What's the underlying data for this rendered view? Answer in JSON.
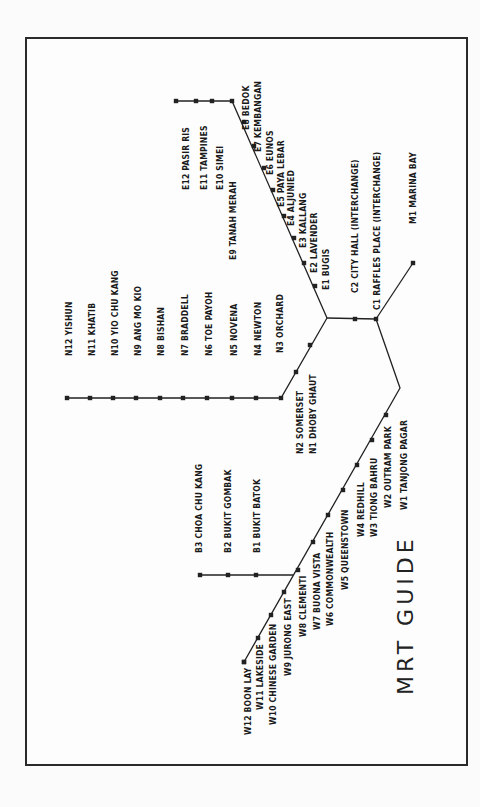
{
  "title": "MRT GUIDE",
  "colors": {
    "line": "#222222",
    "text": "#1a1a1a",
    "frame": "#2a2a2a",
    "background": "#fdfdfd"
  },
  "lines": {
    "east": {
      "path": [
        [
          176,
          101
        ],
        [
          232,
          101
        ],
        [
          327,
          318
        ]
      ],
      "stations": [
        {
          "code": "E12",
          "name": "PASIR RIS",
          "dot": [
            176,
            101
          ],
          "label": [
            182,
            190
          ]
        },
        {
          "code": "E11",
          "name": "TAMPINES",
          "dot": [
            196,
            101
          ],
          "label": [
            200,
            190
          ]
        },
        {
          "code": "E10",
          "name": "SIMEI",
          "dot": [
            212,
            101
          ],
          "label": [
            216,
            190
          ]
        },
        {
          "code": "E9",
          "name": "TANAH MERAH",
          "dot": [
            232,
            101
          ],
          "label": [
            229,
            260
          ]
        },
        {
          "code": "E8",
          "name": "BEDOK",
          "dot": [
            244,
            122
          ],
          "label": [
            242,
            130
          ]
        },
        {
          "code": "E7",
          "name": "KEMBANGAN",
          "dot": [
            254,
            146
          ],
          "label": [
            254,
            152
          ]
        },
        {
          "code": "E6",
          "name": "EUNOS",
          "dot": [
            264,
            168
          ],
          "label": [
            266,
            175
          ]
        },
        {
          "code": "E5",
          "name": "PAYA LEBAR",
          "dot": [
            273,
            190
          ],
          "label": [
            277,
            207
          ]
        },
        {
          "code": "E4",
          "name": "ALJUNIED",
          "dot": [
            284,
            216
          ],
          "label": [
            287,
            226
          ]
        },
        {
          "code": "E3",
          "name": "KALLANG",
          "dot": [
            294,
            238
          ],
          "label": [
            299,
            248
          ]
        },
        {
          "code": "E2",
          "name": "LAVENDER",
          "dot": [
            304,
            263
          ],
          "label": [
            310,
            273
          ]
        },
        {
          "code": "E1",
          "name": "BUGIS",
          "dot": [
            315,
            286
          ],
          "label": [
            322,
            290
          ]
        }
      ]
    },
    "central": {
      "path": [
        [
          327,
          318
        ],
        [
          376,
          319
        ]
      ],
      "stations": [
        {
          "code": "C2",
          "name": "CITY HALL (INTERCHANGE)",
          "dot": [
            355,
            319
          ],
          "label": [
            351,
            293
          ]
        },
        {
          "code": "C1",
          "name": "RAFFLES PLACE (INTERCHANGE)",
          "dot": [
            376,
            319
          ],
          "label": [
            373,
            310
          ]
        }
      ]
    },
    "marina": {
      "path": [
        [
          376,
          319
        ],
        [
          413,
          263
        ]
      ],
      "stations": [
        {
          "code": "M1",
          "name": "MARINA BAY",
          "dot": [
            413,
            263
          ],
          "label": [
            409,
            224
          ]
        }
      ]
    },
    "north": {
      "path": [
        [
          327,
          318
        ],
        [
          281,
          398
        ],
        [
          67,
          398
        ]
      ],
      "stations": [
        {
          "code": "N12",
          "name": "YISHUN",
          "dot": [
            67,
            398
          ],
          "label": [
            65,
            356
          ]
        },
        {
          "code": "N11",
          "name": "KHATIB",
          "dot": [
            90,
            398
          ],
          "label": [
            88,
            356
          ]
        },
        {
          "code": "N10",
          "name": "YIO CHU KANG",
          "dot": [
            113,
            398
          ],
          "label": [
            111,
            356
          ]
        },
        {
          "code": "N9",
          "name": "ANG MO KIO",
          "dot": [
            136,
            398
          ],
          "label": [
            134,
            356
          ]
        },
        {
          "code": "N8",
          "name": "BISHAN",
          "dot": [
            160,
            398
          ],
          "label": [
            157,
            356
          ]
        },
        {
          "code": "N7",
          "name": "BRADDELL",
          "dot": [
            183,
            398
          ],
          "label": [
            181,
            356
          ]
        },
        {
          "code": "N6",
          "name": "TOE PAYOH",
          "dot": [
            207,
            398
          ],
          "label": [
            205,
            356
          ]
        },
        {
          "code": "N5",
          "name": "NOVENA",
          "dot": [
            232,
            398
          ],
          "label": [
            230,
            356
          ]
        },
        {
          "code": "N4",
          "name": "NEWTON",
          "dot": [
            256,
            398
          ],
          "label": [
            254,
            356
          ]
        },
        {
          "code": "N3",
          "name": "ORCHARD",
          "dot": [
            310,
            345
          ],
          "label": [
            276,
            353
          ]
        },
        {
          "code": "N2",
          "name": "SOMERSET",
          "dot": [
            296,
            372
          ],
          "label": [
            296,
            454
          ]
        },
        {
          "code": "N1",
          "name": "DHOBY GHAUT",
          "dot": [
            281,
            398
          ],
          "label": [
            309,
            454
          ]
        }
      ]
    },
    "west": {
      "path": [
        [
          376,
          319
        ],
        [
          400,
          388
        ],
        [
          244,
          662
        ]
      ],
      "stations": [
        {
          "code": "W1",
          "name": "TANJONG PAGAR",
          "dot": [
            386,
            415
          ],
          "label": [
            400,
            510
          ]
        },
        {
          "code": "W2",
          "name": "OUTRAM PARK",
          "dot": [
            372,
            440
          ],
          "label": [
            384,
            508
          ]
        },
        {
          "code": "W3",
          "name": "TIONG BAHRU",
          "dot": [
            357,
            465
          ],
          "label": [
            370,
            537
          ]
        },
        {
          "code": "W4",
          "name": "REDHILL",
          "dot": [
            343,
            490
          ],
          "label": [
            357,
            537
          ]
        },
        {
          "code": "W5",
          "name": "QUEENSTOWN",
          "dot": [
            328,
            515
          ],
          "label": [
            341,
            590
          ]
        },
        {
          "code": "W6",
          "name": "COMMONWEALTH",
          "dot": [
            313,
            542
          ],
          "label": [
            326,
            626
          ]
        },
        {
          "code": "W7",
          "name": "BUONA VISTA",
          "dot": [
            298,
            570
          ],
          "label": [
            313,
            630
          ]
        },
        {
          "code": "W8",
          "name": "CLEMENTI",
          "dot": [
            284,
            592
          ],
          "label": [
            299,
            637
          ]
        },
        {
          "code": "W9",
          "name": "JURONG EAST",
          "dot": [
            271,
            615
          ],
          "label": [
            284,
            676
          ]
        },
        {
          "code": "W10",
          "name": "CHINESE GARDEN",
          "dot": [
            258,
            638
          ],
          "label": [
            269,
            725
          ]
        },
        {
          "code": "W11",
          "name": "LAKESIDE",
          "dot": [
            244,
            662
          ],
          "label": [
            256,
            710
          ]
        },
        {
          "code": "W12",
          "name": "BOON LAY",
          "dot": [
            244,
            662
          ],
          "label": [
            244,
            735
          ]
        }
      ]
    },
    "bukit": {
      "path": [
        [
          200,
          575
        ],
        [
          293,
          575
        ]
      ],
      "stations": [
        {
          "code": "B3",
          "name": "CHOA CHU KANG",
          "dot": [
            200,
            575
          ],
          "label": [
            195,
            553
          ]
        },
        {
          "code": "B2",
          "name": "BUKIT GOMBAK",
          "dot": [
            228,
            575
          ],
          "label": [
            224,
            553
          ]
        },
        {
          "code": "B1",
          "name": "BUKIT BATOK",
          "dot": [
            256,
            575
          ],
          "label": [
            253,
            553
          ]
        }
      ]
    }
  },
  "title_pos": [
    393,
    695
  ]
}
